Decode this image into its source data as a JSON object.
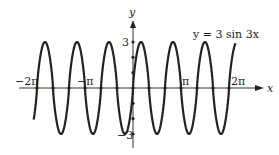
{
  "chart_data": {
    "type": "line",
    "title": "y = 3 sin 3x",
    "function": "y = 3 sin 3x",
    "xlabel": "x",
    "ylabel": "y",
    "x_ticks": [
      "-2π",
      "-π",
      "π",
      "2π"
    ],
    "x_tick_values": [
      -6.2832,
      -3.1416,
      3.1416,
      6.2832
    ],
    "y_ticks": [
      "3",
      "-3"
    ],
    "y_tick_values": [
      3,
      -3
    ],
    "xlim": [
      -6.5,
      6.75
    ],
    "ylim": [
      -3,
      3
    ],
    "amplitude": 3,
    "angular_frequency": 3,
    "period": "2π/3",
    "zeros_marked": "multiples of π/3 from -2π to 2π",
    "grid": false,
    "legend": "none"
  },
  "labels": {
    "equation": "y = 3 sin 3x",
    "x_axis": "x",
    "y_axis": "y",
    "x_neg_2pi": "−2π",
    "x_neg_pi": "−π",
    "x_pi": "π",
    "x_2pi": "2π",
    "y_pos3": "3",
    "y_neg3": "−3"
  }
}
